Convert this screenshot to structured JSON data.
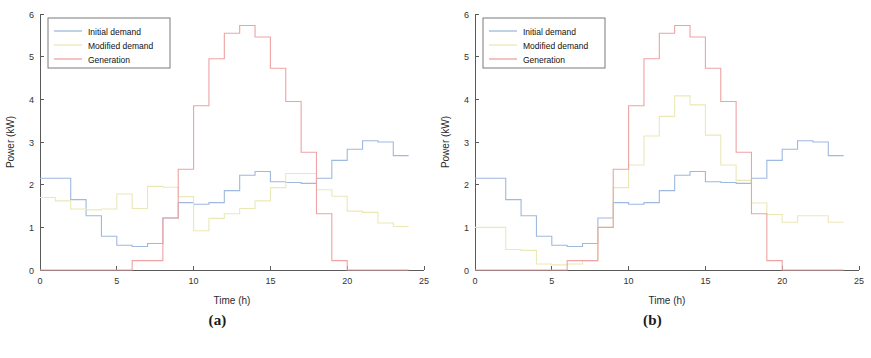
{
  "figure": {
    "panels": [
      {
        "caption": "(a)",
        "xlabel": "Time (h)",
        "ylabel": "Power (kW)",
        "legend": [
          "Initial demand",
          "Modified demand",
          "Generation"
        ]
      },
      {
        "caption": "(b)",
        "xlabel": "Time (h)",
        "ylabel": "Power (kW)",
        "legend": [
          "Initial demand",
          "Modified demand",
          "Generation"
        ]
      }
    ]
  },
  "colors": {
    "initial_demand": "#9fb8de",
    "modified_demand": "#ece8b6",
    "generation": "#eda3a3",
    "axis": "#5a5a5a",
    "text": "#222222"
  },
  "chart_data": [
    {
      "type": "line",
      "subtype": "step",
      "title": "(a)",
      "xlabel": "Time (h)",
      "ylabel": "Power (kW)",
      "xlim": [
        0,
        25
      ],
      "ylim": [
        0,
        6
      ],
      "xticks": [
        0,
        5,
        10,
        15,
        20,
        25
      ],
      "yticks": [
        0,
        1,
        2,
        3,
        4,
        5,
        6
      ],
      "grid": false,
      "legend_position": "upper-left",
      "x": [
        1,
        2,
        3,
        4,
        5,
        6,
        7,
        8,
        9,
        10,
        11,
        12,
        13,
        14,
        15,
        16,
        17,
        18,
        19,
        20,
        21,
        22,
        23,
        24
      ],
      "series": [
        {
          "name": "Initial demand",
          "color": "#9fb8de",
          "values": [
            2.15,
            2.15,
            1.65,
            1.27,
            0.79,
            0.58,
            0.55,
            0.62,
            1.22,
            1.58,
            1.54,
            1.58,
            1.86,
            2.22,
            2.31,
            2.07,
            2.05,
            2.03,
            2.15,
            2.57,
            2.83,
            3.03,
            3.0,
            2.68
          ]
        },
        {
          "name": "Modified demand",
          "color": "#ece8b6",
          "values": [
            1.7,
            1.62,
            1.43,
            1.41,
            1.43,
            1.78,
            1.44,
            1.96,
            1.94,
            1.72,
            0.92,
            1.21,
            1.32,
            1.44,
            1.62,
            1.93,
            2.26,
            2.26,
            1.88,
            1.73,
            1.38,
            1.35,
            1.1,
            1.02
          ]
        },
        {
          "name": "Generation",
          "color": "#eda3a3",
          "values": [
            0.0,
            0.0,
            0.0,
            0.0,
            0.0,
            0.0,
            0.22,
            0.22,
            1.22,
            2.36,
            3.85,
            4.95,
            5.55,
            5.73,
            5.46,
            4.73,
            3.95,
            2.76,
            1.32,
            0.22,
            0.0,
            0.0,
            0.0,
            0.0
          ]
        }
      ]
    },
    {
      "type": "line",
      "subtype": "step",
      "title": "(b)",
      "xlabel": "Time (h)",
      "ylabel": "Power (kW)",
      "xlim": [
        0,
        25
      ],
      "ylim": [
        0,
        6
      ],
      "xticks": [
        0,
        5,
        10,
        15,
        20,
        25
      ],
      "yticks": [
        0,
        1,
        2,
        3,
        4,
        5,
        6
      ],
      "grid": false,
      "legend_position": "upper-left",
      "x": [
        1,
        2,
        3,
        4,
        5,
        6,
        7,
        8,
        9,
        10,
        11,
        12,
        13,
        14,
        15,
        16,
        17,
        18,
        19,
        20,
        21,
        22,
        23,
        24
      ],
      "series": [
        {
          "name": "Initial demand",
          "color": "#9fb8de",
          "values": [
            2.15,
            2.15,
            1.65,
            1.27,
            0.79,
            0.58,
            0.55,
            0.62,
            1.22,
            1.58,
            1.54,
            1.58,
            1.86,
            2.22,
            2.31,
            2.07,
            2.05,
            2.03,
            2.15,
            2.57,
            2.83,
            3.03,
            3.0,
            2.68
          ]
        },
        {
          "name": "Modified demand",
          "color": "#ece8b6",
          "values": [
            1.0,
            1.0,
            0.48,
            0.46,
            0.14,
            0.12,
            0.14,
            0.22,
            1.0,
            1.93,
            2.46,
            3.14,
            3.6,
            4.08,
            3.87,
            3.16,
            2.46,
            2.1,
            1.57,
            1.3,
            1.12,
            1.27,
            1.27,
            1.12
          ]
        },
        {
          "name": "Generation",
          "color": "#eda3a3",
          "values": [
            0.0,
            0.0,
            0.0,
            0.0,
            0.0,
            0.0,
            0.22,
            0.22,
            1.0,
            2.36,
            3.85,
            4.95,
            5.55,
            5.73,
            5.46,
            4.73,
            3.95,
            2.76,
            1.32,
            0.22,
            0.0,
            0.0,
            0.0,
            0.0
          ]
        }
      ]
    }
  ]
}
